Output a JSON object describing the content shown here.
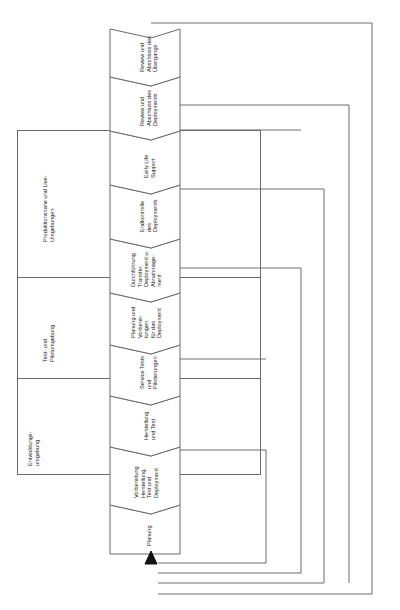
{
  "diagram": {
    "orientation": "rotated-90-ccw",
    "process_chain": {
      "name": "Prozesskette Deployment",
      "arrow_into_start": true,
      "steps": [
        {
          "id": "planung",
          "label": "Planung"
        },
        {
          "id": "vorbereitung",
          "label": "Vorbereitung\nHerstellung,\nTest und\nDeployment"
        },
        {
          "id": "herstellung",
          "label": "Herstellung\nund Test"
        },
        {
          "id": "service-tests",
          "label": "Service Tests\nund\nPilotierungen"
        },
        {
          "id": "planung-vorb",
          "label": "Planung und\nVorberei-\ntungen\nfür das\nDeployment"
        },
        {
          "id": "durchfuehrung",
          "label": "Durchführung\nTransfer,\nDeployment u.\nAbnahmage-\nment"
        },
        {
          "id": "endkontrolle",
          "label": "Endkontrolle\ndes\nDeployments"
        },
        {
          "id": "early-life",
          "label": "Early Life\nSupport"
        },
        {
          "id": "review-depl",
          "label": "Review und\nAbschluss des\nDeployments"
        },
        {
          "id": "review-trans",
          "label": "Review und\nAbschluss des\nÜbergangs"
        }
      ]
    },
    "environments": {
      "name": "Umgebungen",
      "lanes": [
        {
          "id": "entwicklung",
          "label": "Entwicklungs-\numgebung"
        },
        {
          "id": "test-pilot",
          "label": "Test- und\nPilotumgebung"
        },
        {
          "id": "produktion",
          "label": "Produktionsnahe und Live-\nUmgebungen"
        }
      ]
    },
    "feedback_loops": {
      "name": "Rücksprung-/Feedbackschleifen",
      "count": 4,
      "loops": [
        {
          "id": "loop-1",
          "from_step": "vorbereitung",
          "to_step": "planung"
        },
        {
          "id": "loop-2",
          "from_step": "service-tests",
          "to_step": "planung"
        },
        {
          "id": "loop-3",
          "from_step": "endkontrolle",
          "to_step": "planung"
        },
        {
          "id": "loop-4",
          "from_step": "review-trans",
          "to_step": "planung"
        }
      ]
    },
    "colors": {
      "line": "#6a6a6a",
      "text": "#1c1c1c",
      "fill": "#ffffff",
      "arrow": "#111111"
    }
  }
}
